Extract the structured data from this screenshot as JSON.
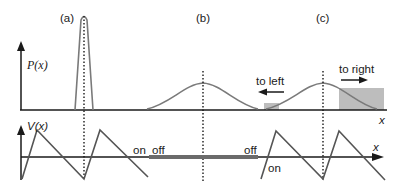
{
  "panels": [
    {
      "label": "(a)"
    },
    {
      "label": "(b)"
    },
    {
      "label": "(c)"
    }
  ],
  "top_axis": {
    "ylabel": "P(x)",
    "xlabel": "x"
  },
  "bottom_axis": {
    "ylabel": "V(x)",
    "xlabel": "x"
  },
  "annotations": {
    "to_left": "to left",
    "to_right": "to right",
    "on_left": "on",
    "off_left": "off",
    "off_right": "off",
    "on_right": "on"
  },
  "colors": {
    "curve": "#7a7a7a",
    "axis": "#1a1a1a",
    "shade": "#bdbdbd",
    "potential_off": "#6b6b6b"
  }
}
